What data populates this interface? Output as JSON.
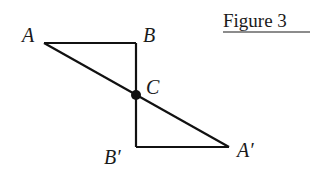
{
  "title": "Figure 3",
  "colors": {
    "stroke": "#111111",
    "text": "#1a1a1a",
    "background": "#ffffff"
  },
  "points": {
    "A": {
      "label": "A",
      "x": 44,
      "y": 43
    },
    "B": {
      "label": "B",
      "x": 136,
      "y": 43
    },
    "C": {
      "label": "C",
      "x": 136,
      "y": 95
    },
    "B_prime": {
      "label": "B′",
      "x": 136,
      "y": 147
    },
    "A_prime": {
      "label": "A′",
      "x": 229,
      "y": 147
    }
  },
  "segments": [
    [
      "A",
      "B"
    ],
    [
      "B",
      "B_prime"
    ],
    [
      "B_prime",
      "A_prime"
    ],
    [
      "A",
      "A_prime"
    ]
  ],
  "marked_point": "C"
}
